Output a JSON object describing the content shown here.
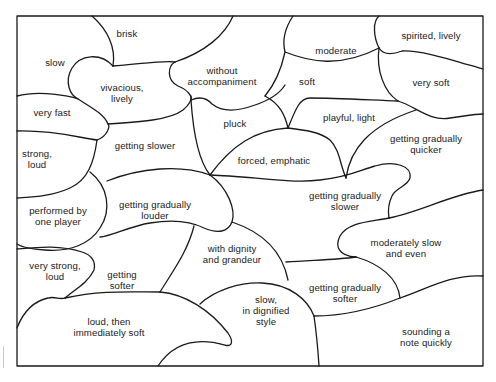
{
  "diagram": {
    "type": "jigsaw-puzzle",
    "frame": {
      "x": 17,
      "y": 16,
      "width": 466,
      "height": 350
    },
    "stroke_color": "#1a1a1a",
    "background": "#ffffff",
    "pieces": [
      {
        "id": "slow",
        "lines": [
          "slow"
        ],
        "x": 55,
        "y": 57
      },
      {
        "id": "brisk",
        "lines": [
          "brisk"
        ],
        "x": 127,
        "y": 28
      },
      {
        "id": "vivacious",
        "lines": [
          "vivacious,",
          "lively"
        ],
        "x": 122,
        "y": 82
      },
      {
        "id": "without-accompaniment",
        "lines": [
          "without",
          "accompaniment"
        ],
        "x": 222,
        "y": 65
      },
      {
        "id": "moderate",
        "lines": [
          "moderate"
        ],
        "x": 336,
        "y": 45
      },
      {
        "id": "spirited",
        "lines": [
          "spirited, lively"
        ],
        "x": 431,
        "y": 30
      },
      {
        "id": "very-fast",
        "lines": [
          "very fast"
        ],
        "x": 52,
        "y": 107
      },
      {
        "id": "soft",
        "lines": [
          "soft"
        ],
        "x": 307,
        "y": 76
      },
      {
        "id": "very-soft",
        "lines": [
          "very soft"
        ],
        "x": 431,
        "y": 77
      },
      {
        "id": "pluck",
        "lines": [
          "pluck"
        ],
        "x": 235,
        "y": 118
      },
      {
        "id": "playful",
        "lines": [
          "playful, light"
        ],
        "x": 349,
        "y": 112
      },
      {
        "id": "strong-loud",
        "lines": [
          "strong,",
          "loud"
        ],
        "x": 37,
        "y": 148
      },
      {
        "id": "getting-slower",
        "lines": [
          "getting slower"
        ],
        "x": 145,
        "y": 140
      },
      {
        "id": "getting-gradually-quicker",
        "lines": [
          "getting gradually",
          "quicker"
        ],
        "x": 426,
        "y": 133
      },
      {
        "id": "forced-emphatic",
        "lines": [
          "forced, emphatic"
        ],
        "x": 274,
        "y": 155
      },
      {
        "id": "performed-by-one-player",
        "lines": [
          "performed by",
          "one player"
        ],
        "x": 58,
        "y": 205
      },
      {
        "id": "getting-gradually-louder",
        "lines": [
          "getting gradually",
          "louder"
        ],
        "x": 155,
        "y": 199
      },
      {
        "id": "getting-gradually-slower",
        "lines": [
          "getting gradually",
          "slower"
        ],
        "x": 345,
        "y": 190
      },
      {
        "id": "with-dignity",
        "lines": [
          "with dignity",
          "and grandeur"
        ],
        "x": 232,
        "y": 243
      },
      {
        "id": "moderately-slow",
        "lines": [
          "moderately slow",
          "and even"
        ],
        "x": 406,
        "y": 237
      },
      {
        "id": "very-strong-loud",
        "lines": [
          "very strong,",
          "loud"
        ],
        "x": 55,
        "y": 260
      },
      {
        "id": "getting-softer",
        "lines": [
          "getting",
          "softer"
        ],
        "x": 122,
        "y": 269
      },
      {
        "id": "getting-gradually-softer",
        "lines": [
          "getting gradually",
          "softer"
        ],
        "x": 345,
        "y": 282
      },
      {
        "id": "slow-dignified",
        "lines": [
          "slow,",
          "in dignified",
          "style"
        ],
        "x": 266,
        "y": 294
      },
      {
        "id": "loud-then-soft",
        "lines": [
          "loud, then",
          "immediately soft"
        ],
        "x": 109,
        "y": 316
      },
      {
        "id": "sounding-note",
        "lines": [
          "sounding a",
          "note quickly"
        ],
        "x": 426,
        "y": 326
      }
    ]
  }
}
